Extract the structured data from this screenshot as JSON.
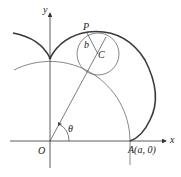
{
  "figure": {
    "labels": {
      "y_axis": "y",
      "x_axis": "x",
      "origin": "O",
      "point_p": "P",
      "radius_b": "b",
      "center_c": "C",
      "angle": "θ",
      "point_a": "A(a, 0)"
    },
    "colors": {
      "curve": "#3a3a3a",
      "thin": "#555555",
      "axis": "#333333"
    }
  }
}
